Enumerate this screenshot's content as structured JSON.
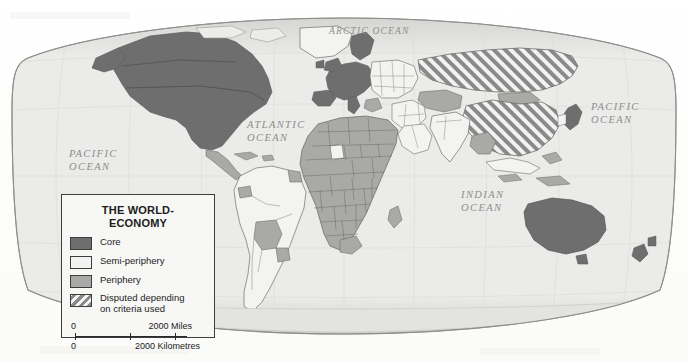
{
  "map": {
    "projection_label": "world map",
    "title_in_legend": "THE WORLD-\nECONOMY",
    "ocean_labels": [
      {
        "name": "arctic-ocean",
        "text": "ARCTIC OCEAN"
      },
      {
        "name": "atlantic-ocean",
        "text": "ATLANTIC\nOCEAN"
      },
      {
        "name": "pacific-ocean-left",
        "text": "PACIFIC\nOCEAN"
      },
      {
        "name": "pacific-ocean-right",
        "text": "PACIFIC\nOCEAN"
      },
      {
        "name": "indian-ocean",
        "text": "INDIAN\nOCEAN"
      }
    ]
  },
  "legend": {
    "title_line1": "THE WORLD-",
    "title_line2": "ECONOMY",
    "items": [
      {
        "label": "Core",
        "swatch": "core",
        "color": "#6e6e6e"
      },
      {
        "label": "Semi-periphery",
        "swatch": "semi",
        "color": "#f3f3f1"
      },
      {
        "label": "Periphery",
        "swatch": "peri",
        "color": "#a9a9a7"
      },
      {
        "label": "Disputed depending\non criteria used",
        "swatch": "disputed",
        "color": "#8a8a8a"
      }
    ],
    "scale": {
      "miles": {
        "zero": "0",
        "value": "2000 Miles"
      },
      "kilometres": {
        "zero": "0",
        "value": "2000 Kilometres"
      }
    }
  },
  "colors": {
    "ocean": "#e9e9e7",
    "core": "#6e6e6e",
    "semi_periphery": "#f3f3f1",
    "periphery": "#a9a9a7",
    "disputed_hatch": "#8a8a8a",
    "border": "#6f6f6d",
    "graticule": "#d8d8d6",
    "page": "#ffffff"
  },
  "regions": {
    "core": [
      "North America (USA, Canada)",
      "Western Europe",
      "Japan",
      "Australia",
      "New Zealand",
      "Israel"
    ],
    "semi_periphery": [
      "Brazil",
      "Argentina",
      "Chile",
      "Mexico",
      "South Africa",
      "Eastern Europe",
      "India",
      "Turkey",
      "Saudi Arabia",
      "South Korea",
      "Indonesia"
    ],
    "periphery": [
      "Sub-Saharan Africa",
      "Bolivia",
      "Paraguay",
      "Central America",
      "Central Asia",
      "Mongolia",
      "Southeast Asia",
      "Pacific islands"
    ],
    "disputed": [
      "China",
      "Russia"
    ]
  }
}
